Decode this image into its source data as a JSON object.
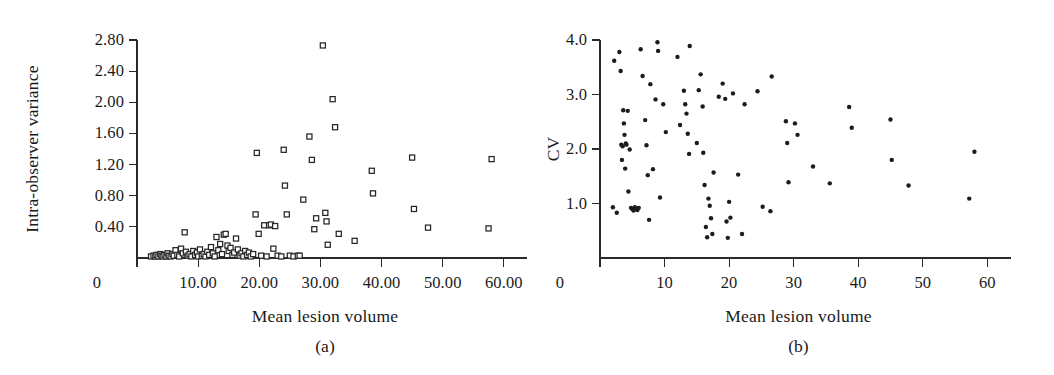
{
  "figure": {
    "panels": [
      {
        "id": "panel-a",
        "caption": "(a)",
        "xlabel": "Mean lesion volume",
        "ylabel": "Intra-observer variance",
        "xticks": [
          "0",
          "10.00",
          "20.00",
          "30.00",
          "40.00",
          "50.00",
          "60.00"
        ],
        "yticks": [
          "0.40",
          "0.80",
          "1.20",
          "1.60",
          "2.00",
          "2.40",
          "2.80"
        ]
      },
      {
        "id": "panel-b",
        "caption": "(b)",
        "xlabel": "Mean lesion volume",
        "ylabel": "CV",
        "xticks": [
          "0",
          "10",
          "20",
          "30",
          "40",
          "50",
          "60"
        ],
        "yticks": [
          "1.0",
          "2.0",
          "3.0",
          "4.0"
        ]
      }
    ]
  },
  "chart_data": [
    {
      "type": "scatter",
      "panel": "(a)",
      "title": "",
      "xlabel": "Mean lesion volume",
      "ylabel": "Intra-observer variance",
      "xlim": [
        0,
        62
      ],
      "ylim": [
        0,
        2.9
      ],
      "xticks": [
        0,
        10,
        20,
        30,
        40,
        50,
        60
      ],
      "xtick_labels": [
        "0",
        "10.00",
        "20.00",
        "30.00",
        "40.00",
        "50.00",
        "60.00"
      ],
      "yticks": [
        0.4,
        0.8,
        1.2,
        1.6,
        2.0,
        2.4,
        2.8
      ],
      "ytick_labels": [
        "0.40",
        "0.80",
        "1.20",
        "1.60",
        "2.00",
        "2.40",
        "2.80"
      ],
      "grid": false,
      "legend": null,
      "marker": "open-square",
      "points": [
        [
          2.3,
          0.02
        ],
        [
          2.7,
          0.03
        ],
        [
          3.0,
          0.02
        ],
        [
          3.2,
          0.04
        ],
        [
          3.5,
          0.02
        ],
        [
          3.8,
          0.05
        ],
        [
          4.0,
          0.03
        ],
        [
          4.2,
          0.02
        ],
        [
          4.5,
          0.04
        ],
        [
          4.8,
          0.02
        ],
        [
          5.0,
          0.06
        ],
        [
          5.2,
          0.03
        ],
        [
          5.5,
          0.02
        ],
        [
          5.8,
          0.05
        ],
        [
          6.0,
          0.03
        ],
        [
          6.3,
          0.1
        ],
        [
          6.6,
          0.04
        ],
        [
          6.9,
          0.02
        ],
        [
          7.2,
          0.12
        ],
        [
          7.5,
          0.06
        ],
        [
          7.8,
          0.33
        ],
        [
          8.0,
          0.08
        ],
        [
          8.3,
          0.03
        ],
        [
          8.6,
          0.05
        ],
        [
          8.9,
          0.02
        ],
        [
          9.2,
          0.09
        ],
        [
          9.5,
          0.04
        ],
        [
          9.8,
          0.07
        ],
        [
          10.0,
          0.02
        ],
        [
          10.3,
          0.11
        ],
        [
          10.6,
          0.03
        ],
        [
          10.9,
          0.05
        ],
        [
          11.2,
          0.02
        ],
        [
          11.5,
          0.08
        ],
        [
          11.8,
          0.04
        ],
        [
          12.1,
          0.14
        ],
        [
          12.4,
          0.06
        ],
        [
          12.7,
          0.02
        ],
        [
          13.0,
          0.27
        ],
        [
          13.3,
          0.1
        ],
        [
          13.6,
          0.18
        ],
        [
          13.9,
          0.05
        ],
        [
          14.2,
          0.3
        ],
        [
          14.5,
          0.31
        ],
        [
          14.8,
          0.16
        ],
        [
          15.0,
          0.09
        ],
        [
          15.3,
          0.13
        ],
        [
          15.6,
          0.04
        ],
        [
          15.9,
          0.07
        ],
        [
          16.2,
          0.25
        ],
        [
          16.5,
          0.11
        ],
        [
          16.8,
          0.03
        ],
        [
          17.1,
          0.06
        ],
        [
          17.4,
          0.02
        ],
        [
          17.7,
          0.09
        ],
        [
          18.0,
          0.04
        ],
        [
          18.3,
          0.07
        ],
        [
          18.6,
          0.02
        ],
        [
          19.0,
          0.05
        ],
        [
          19.4,
          0.56
        ],
        [
          19.6,
          1.35
        ],
        [
          19.9,
          0.31
        ],
        [
          20.3,
          0.03
        ],
        [
          20.8,
          0.42
        ],
        [
          21.2,
          0.02
        ],
        [
          21.6,
          0.42
        ],
        [
          21.9,
          0.43
        ],
        [
          22.3,
          0.12
        ],
        [
          22.6,
          0.41
        ],
        [
          23.0,
          0.03
        ],
        [
          23.6,
          0.02
        ],
        [
          24.0,
          1.39
        ],
        [
          24.2,
          0.93
        ],
        [
          24.5,
          0.56
        ],
        [
          25.0,
          0.03
        ],
        [
          25.6,
          0.02
        ],
        [
          26.3,
          0.03
        ],
        [
          26.6,
          0.03
        ],
        [
          27.2,
          0.75
        ],
        [
          28.2,
          1.56
        ],
        [
          28.6,
          1.26
        ],
        [
          29.0,
          0.37
        ],
        [
          29.3,
          0.51
        ],
        [
          30.4,
          2.73
        ],
        [
          30.8,
          0.58
        ],
        [
          31.0,
          0.47
        ],
        [
          31.2,
          0.17
        ],
        [
          32.0,
          2.04
        ],
        [
          32.4,
          1.68
        ],
        [
          33.0,
          0.31
        ],
        [
          35.6,
          0.22
        ],
        [
          38.4,
          1.12
        ],
        [
          38.6,
          0.83
        ],
        [
          45.0,
          1.29
        ],
        [
          45.3,
          0.63
        ],
        [
          47.6,
          0.39
        ],
        [
          57.5,
          0.38
        ],
        [
          58.0,
          1.27
        ]
      ]
    },
    {
      "type": "scatter",
      "panel": "(b)",
      "title": "",
      "xlabel": "Mean lesion volume",
      "ylabel": "CV",
      "xlim": [
        0,
        62
      ],
      "ylim": [
        0,
        4.2
      ],
      "xticks": [
        0,
        10,
        20,
        30,
        40,
        50,
        60
      ],
      "xtick_labels": [
        "0",
        "10",
        "20",
        "30",
        "40",
        "50",
        "60"
      ],
      "yticks": [
        1.0,
        2.0,
        3.0,
        4.0
      ],
      "ytick_labels": [
        "1.0",
        "2.0",
        "3.0",
        "4.0"
      ],
      "grid": false,
      "legend": null,
      "marker": "filled-dot",
      "points": [
        [
          2.0,
          0.93
        ],
        [
          2.2,
          3.62
        ],
        [
          2.6,
          0.83
        ],
        [
          3.0,
          3.78
        ],
        [
          3.2,
          3.43
        ],
        [
          3.3,
          2.08
        ],
        [
          3.4,
          1.8
        ],
        [
          3.5,
          2.05
        ],
        [
          3.6,
          2.71
        ],
        [
          3.7,
          2.47
        ],
        [
          3.8,
          2.26
        ],
        [
          3.9,
          1.64
        ],
        [
          4.0,
          2.1
        ],
        [
          4.1,
          2.08
        ],
        [
          4.3,
          2.7
        ],
        [
          4.4,
          1.22
        ],
        [
          4.6,
          1.99
        ],
        [
          4.8,
          0.92
        ],
        [
          5.0,
          0.9
        ],
        [
          5.2,
          0.87
        ],
        [
          5.4,
          0.93
        ],
        [
          5.6,
          0.9
        ],
        [
          5.8,
          0.88
        ],
        [
          6.0,
          0.92
        ],
        [
          6.3,
          3.83
        ],
        [
          6.6,
          3.34
        ],
        [
          7.0,
          2.53
        ],
        [
          7.2,
          2.07
        ],
        [
          7.4,
          1.52
        ],
        [
          7.6,
          0.7
        ],
        [
          7.8,
          3.19
        ],
        [
          8.2,
          1.63
        ],
        [
          8.6,
          2.91
        ],
        [
          8.9,
          3.96
        ],
        [
          9.0,
          3.8
        ],
        [
          9.3,
          1.11
        ],
        [
          9.8,
          2.82
        ],
        [
          10.2,
          2.31
        ],
        [
          12.0,
          3.69
        ],
        [
          12.4,
          2.44
        ],
        [
          13.0,
          3.07
        ],
        [
          13.2,
          2.82
        ],
        [
          13.4,
          2.65
        ],
        [
          13.6,
          2.28
        ],
        [
          13.8,
          1.91
        ],
        [
          13.9,
          3.89
        ],
        [
          15.0,
          2.11
        ],
        [
          15.3,
          3.08
        ],
        [
          15.6,
          3.37
        ],
        [
          15.9,
          2.78
        ],
        [
          16.0,
          1.93
        ],
        [
          16.2,
          1.34
        ],
        [
          16.4,
          0.57
        ],
        [
          16.6,
          0.38
        ],
        [
          16.8,
          1.09
        ],
        [
          17.0,
          0.96
        ],
        [
          17.2,
          0.73
        ],
        [
          17.4,
          0.44
        ],
        [
          17.6,
          1.57
        ],
        [
          18.4,
          2.96
        ],
        [
          19.0,
          3.2
        ],
        [
          19.4,
          2.92
        ],
        [
          19.6,
          0.67
        ],
        [
          19.8,
          0.37
        ],
        [
          20.0,
          1.03
        ],
        [
          20.2,
          0.74
        ],
        [
          20.6,
          3.02
        ],
        [
          21.4,
          1.53
        ],
        [
          22.0,
          0.44
        ],
        [
          22.4,
          2.82
        ],
        [
          24.4,
          3.06
        ],
        [
          25.2,
          0.94
        ],
        [
          26.4,
          0.86
        ],
        [
          26.6,
          3.33
        ],
        [
          28.8,
          2.51
        ],
        [
          29.0,
          2.11
        ],
        [
          29.2,
          1.39
        ],
        [
          30.2,
          2.47
        ],
        [
          30.6,
          2.26
        ],
        [
          33.0,
          1.68
        ],
        [
          35.6,
          1.37
        ],
        [
          38.6,
          2.77
        ],
        [
          39.0,
          2.39
        ],
        [
          45.0,
          2.54
        ],
        [
          45.2,
          1.8
        ],
        [
          47.8,
          1.33
        ],
        [
          57.2,
          1.09
        ],
        [
          58.0,
          1.95
        ]
      ]
    }
  ]
}
